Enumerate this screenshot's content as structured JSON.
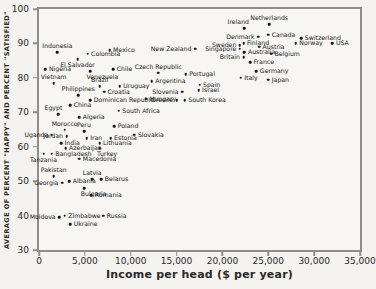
{
  "chart_data": {
    "type": "scatter",
    "title": "",
    "xlabel": "Income per head ($ per year)",
    "ylabel": "AVERAGE OF PERCENT \"HAPPY\" AND PERCENT \"SATISFIED\"",
    "xlim": [
      0,
      35000
    ],
    "ylim": [
      30,
      100
    ],
    "grid": false,
    "legend": false,
    "x_ticks": [
      {
        "value": 0,
        "label": "0"
      },
      {
        "value": 5000,
        "label": "5,000"
      },
      {
        "value": 10000,
        "label": "10,000"
      },
      {
        "value": 15000,
        "label": "15,000"
      },
      {
        "value": 20000,
        "label": "20,000"
      },
      {
        "value": 25000,
        "label": "25,000"
      },
      {
        "value": 30000,
        "label": "30,000"
      },
      {
        "value": 35000,
        "label": "35,000"
      }
    ],
    "y_ticks": [
      {
        "value": 100,
        "label": "100"
      },
      {
        "value": 90,
        "label": "90"
      },
      {
        "value": 80,
        "label": "80"
      },
      {
        "value": 70,
        "label": "70"
      },
      {
        "value": 60,
        "label": "60"
      },
      {
        "value": 50,
        "label": "50"
      },
      {
        "value": 40,
        "label": "40"
      },
      {
        "value": 30,
        "label": "30"
      }
    ],
    "points": [
      {
        "name": "Indonesia",
        "x": 2000,
        "y": 87.5,
        "lp": "t"
      },
      {
        "name": "Nigeria",
        "x": 700,
        "y": 82.5,
        "lp": "r"
      },
      {
        "name": "Vietnam",
        "x": 1600,
        "y": 78.5,
        "lp": "t"
      },
      {
        "name": "Philippines",
        "x": 4300,
        "y": 75,
        "lp": "t"
      },
      {
        "name": "Egypt",
        "x": 2100,
        "y": 69.5,
        "lp": "tl"
      },
      {
        "name": "China",
        "x": 3400,
        "y": 72,
        "lp": "r"
      },
      {
        "name": "Morocco",
        "x": 2800,
        "y": 65,
        "lp": "t"
      },
      {
        "name": "Uganda",
        "x": 1400,
        "y": 63.5,
        "lp": "l"
      },
      {
        "name": "Jordan",
        "x": 3000,
        "y": 63,
        "lp": "l"
      },
      {
        "name": "India",
        "x": 2400,
        "y": 61,
        "lp": "r"
      },
      {
        "name": "Azerbaijan",
        "x": 2900,
        "y": 59.5,
        "lp": "r"
      },
      {
        "name": "Bangladesh",
        "x": 1400,
        "y": 58,
        "lp": "r"
      },
      {
        "name": "Tanzania",
        "x": 500,
        "y": 58,
        "lp": "b"
      },
      {
        "name": "Pakistan",
        "x": 1600,
        "y": 51.5,
        "lp": "t"
      },
      {
        "name": "Georgia",
        "x": 2500,
        "y": 49.5,
        "lp": "l"
      },
      {
        "name": "Albania",
        "x": 3300,
        "y": 50,
        "lp": "r"
      },
      {
        "name": "Moldova",
        "x": 2200,
        "y": 39.5,
        "lp": "l"
      },
      {
        "name": "Zimbabwe",
        "x": 2800,
        "y": 40,
        "lp": "r"
      },
      {
        "name": "Ukraine",
        "x": 3400,
        "y": 37.5,
        "lp": "r"
      },
      {
        "name": "Russia",
        "x": 7000,
        "y": 40,
        "lp": "r"
      },
      {
        "name": "Romania",
        "x": 5700,
        "y": 46,
        "lp": "r"
      },
      {
        "name": "Bulgaria",
        "x": 4900,
        "y": 48,
        "lp": "br"
      },
      {
        "name": "Latvia",
        "x": 5800,
        "y": 50.5,
        "lp": "t"
      },
      {
        "name": "Belarus",
        "x": 6800,
        "y": 50.5,
        "lp": "r"
      },
      {
        "name": "Macedonia",
        "x": 4400,
        "y": 56.5,
        "lp": "r"
      },
      {
        "name": "Turkey",
        "x": 6600,
        "y": 59.5,
        "lp": "br"
      },
      {
        "name": "Lithuania",
        "x": 6600,
        "y": 61,
        "lp": "r"
      },
      {
        "name": "Estonia",
        "x": 7800,
        "y": 62.5,
        "lp": "r"
      },
      {
        "name": "Iran",
        "x": 5200,
        "y": 62.5,
        "lp": "r"
      },
      {
        "name": "Peru",
        "x": 4900,
        "y": 64.5,
        "lp": "t"
      },
      {
        "name": "Poland",
        "x": 8200,
        "y": 66,
        "lp": "r"
      },
      {
        "name": "Slovakia",
        "x": 10400,
        "y": 63.5,
        "lp": "r"
      },
      {
        "name": "Algeria",
        "x": 4400,
        "y": 68.5,
        "lp": "r"
      },
      {
        "name": "South Africa",
        "x": 8700,
        "y": 70.5,
        "lp": "r"
      },
      {
        "name": "Dominican Republic",
        "x": 5600,
        "y": 73.5,
        "lp": "r"
      },
      {
        "name": "Croatia",
        "x": 7100,
        "y": 76,
        "lp": "r"
      },
      {
        "name": "Brazil",
        "x": 6600,
        "y": 77.5,
        "lp": "t"
      },
      {
        "name": "Uruguay",
        "x": 8800,
        "y": 77.5,
        "lp": "r"
      },
      {
        "name": "Venezuela",
        "x": 5600,
        "y": 82,
        "lp": "br"
      },
      {
        "name": "El Salvador",
        "x": 4200,
        "y": 85.5,
        "lp": "b"
      },
      {
        "name": "Colombia",
        "x": 5300,
        "y": 87,
        "lp": "r"
      },
      {
        "name": "Mexico",
        "x": 7700,
        "y": 88,
        "lp": "r"
      },
      {
        "name": "Chile",
        "x": 8100,
        "y": 82.5,
        "lp": "r"
      },
      {
        "name": "Czech Republic",
        "x": 13000,
        "y": 81.5,
        "lp": "t"
      },
      {
        "name": "Argentina",
        "x": 12300,
        "y": 79,
        "lp": "r"
      },
      {
        "name": "Hungary",
        "x": 11700,
        "y": 74,
        "lp": "r"
      },
      {
        "name": "Greece",
        "x": 15000,
        "y": 73.5,
        "lp": "l"
      },
      {
        "name": "South Korea",
        "x": 15900,
        "y": 73.5,
        "lp": "r"
      },
      {
        "name": "Slovenia",
        "x": 15600,
        "y": 76,
        "lp": "l"
      },
      {
        "name": "Portugal",
        "x": 16000,
        "y": 81,
        "lp": "r"
      },
      {
        "name": "Spain",
        "x": 17500,
        "y": 78,
        "lp": "r"
      },
      {
        "name": "Israel",
        "x": 17400,
        "y": 76.5,
        "lp": "r"
      },
      {
        "name": "New Zealand",
        "x": 17000,
        "y": 88.5,
        "lp": "l"
      },
      {
        "name": "Italy",
        "x": 22000,
        "y": 80,
        "lp": "r"
      },
      {
        "name": "Japan",
        "x": 25000,
        "y": 79.5,
        "lp": "r"
      },
      {
        "name": "Germany",
        "x": 23700,
        "y": 82,
        "lp": "r"
      },
      {
        "name": "France",
        "x": 23000,
        "y": 84.5,
        "lp": "r"
      },
      {
        "name": "Britain",
        "x": 22300,
        "y": 86,
        "lp": "l"
      },
      {
        "name": "Australia",
        "x": 22400,
        "y": 87.5,
        "lp": "r"
      },
      {
        "name": "Belgium",
        "x": 25300,
        "y": 87,
        "lp": "r"
      },
      {
        "name": "Singapore",
        "x": 21900,
        "y": 88.5,
        "lp": "l"
      },
      {
        "name": "Austria",
        "x": 24000,
        "y": 89,
        "lp": "r"
      },
      {
        "name": "Sweden",
        "x": 21900,
        "y": 89.5,
        "lp": "l"
      },
      {
        "name": "Finland",
        "x": 22300,
        "y": 90,
        "lp": "r"
      },
      {
        "name": "Denmark",
        "x": 23900,
        "y": 92,
        "lp": "l"
      },
      {
        "name": "Canada",
        "x": 25000,
        "y": 92.5,
        "lp": "r"
      },
      {
        "name": "Netherlands",
        "x": 25100,
        "y": 95.5,
        "lp": "t"
      },
      {
        "name": "Ireland",
        "x": 22400,
        "y": 94.5,
        "lp": "tl"
      },
      {
        "name": "Switzerland",
        "x": 28600,
        "y": 91.5,
        "lp": "r"
      },
      {
        "name": "Norway",
        "x": 28000,
        "y": 90,
        "lp": "r"
      },
      {
        "name": "USA",
        "x": 32000,
        "y": 90,
        "lp": "r"
      }
    ]
  },
  "colors": {
    "background": "#f4f3f0",
    "frame": "#8d8d8b",
    "dot": "#141414",
    "text": "#1d1d1d"
  }
}
